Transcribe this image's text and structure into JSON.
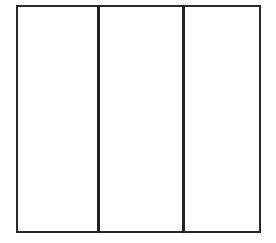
{
  "diagram": {
    "type": "three-column-rectangle",
    "columns": [
      {
        "index": 0,
        "label": ""
      },
      {
        "index": 1,
        "label": ""
      },
      {
        "index": 2,
        "label": ""
      }
    ],
    "colors": {
      "background": "#ffffff",
      "stroke": "#2a2a2a"
    }
  }
}
